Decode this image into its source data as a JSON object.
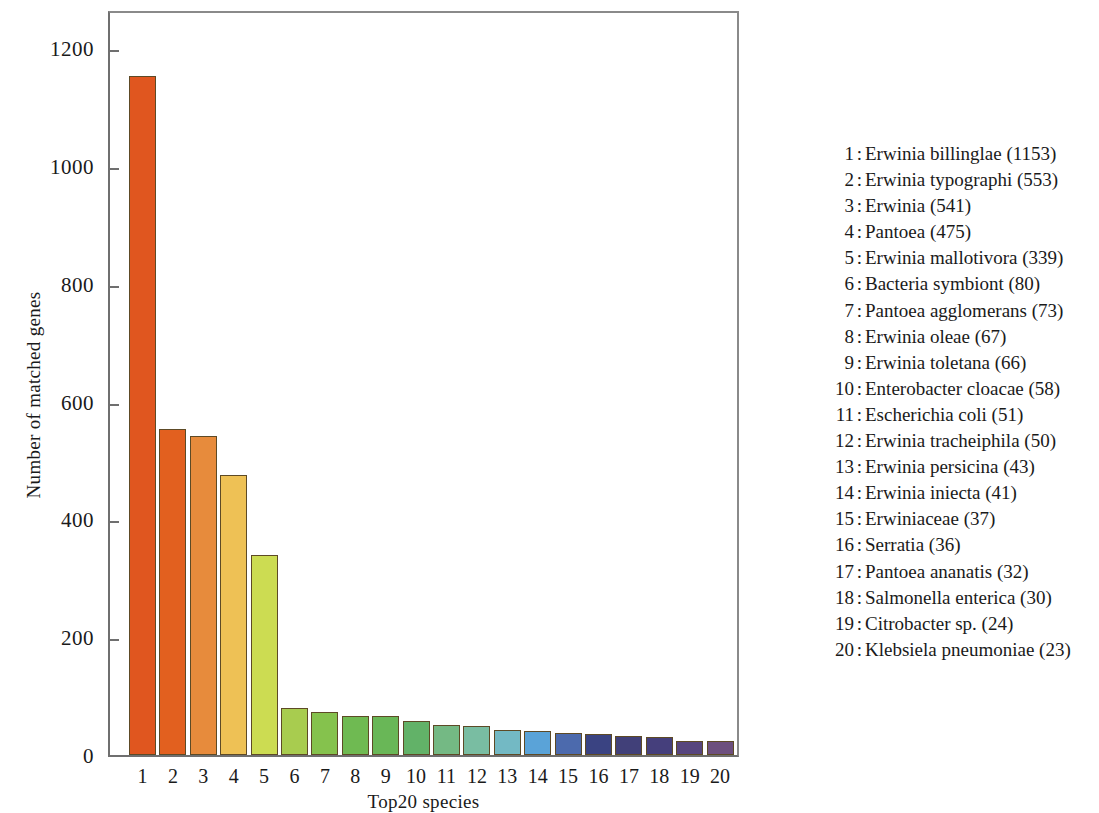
{
  "chart_data": {
    "type": "bar",
    "title": "",
    "xlabel": "Top20 species",
    "ylabel": "Number of matched genes",
    "categories": [
      "1",
      "2",
      "3",
      "4",
      "5",
      "6",
      "7",
      "8",
      "9",
      "10",
      "11",
      "12",
      "13",
      "14",
      "15",
      "16",
      "17",
      "18",
      "19",
      "20"
    ],
    "values": [
      1153,
      553,
      541,
      475,
      339,
      80,
      73,
      67,
      66,
      58,
      51,
      50,
      43,
      41,
      37,
      36,
      32,
      30,
      24,
      23
    ],
    "series_names": [
      "Erwinia billinglae",
      "Erwinia typographi",
      "Erwinia",
      "Pantoea",
      "Erwinia mallotivora",
      "Bacteria symbiont",
      "Pantoea agglomerans",
      "Erwinia oleae",
      "Erwinia toletana",
      "Enterobacter cloacae",
      "Escherichia coli",
      "Erwinia tracheiphila",
      "Erwinia persicina",
      "Erwinia iniecta",
      "Erwiniaceae",
      "Serratia",
      "Pantoea ananatis",
      "Salmonella enterica",
      "Citrobacter sp.",
      "Klebsiela pneumoniae"
    ],
    "bar_colors": [
      "#e0561f",
      "#e2601f",
      "#e78b3c",
      "#eec155",
      "#ccdc52",
      "#a8cc4f",
      "#85c24d",
      "#6fba52",
      "#69b757",
      "#62b268",
      "#74b984",
      "#79bda2",
      "#73b9c4",
      "#5aa3d8",
      "#4c6aad",
      "#3a4382",
      "#414079",
      "#453f7c",
      "#57457e",
      "#6d4f7e"
    ],
    "ylim": [
      0,
      1250
    ],
    "yticks": [
      0,
      200,
      400,
      600,
      800,
      1000,
      1200
    ],
    "ytick_labels": [
      "0",
      "200",
      "400",
      "600",
      "800",
      "1000",
      "1200"
    ],
    "grid": false,
    "legend_position": "right",
    "legend_separator": ":"
  },
  "legend": {
    "entries": [
      {
        "index": "1",
        "name": "Erwinia billinglae (1153)"
      },
      {
        "index": "2",
        "name": "Erwinia typographi (553)"
      },
      {
        "index": "3",
        "name": "Erwinia (541)"
      },
      {
        "index": "4",
        "name": "Pantoea (475)"
      },
      {
        "index": "5",
        "name": "Erwinia mallotivora (339)"
      },
      {
        "index": "6",
        "name": "Bacteria symbiont (80)"
      },
      {
        "index": "7",
        "name": "Pantoea agglomerans (73)"
      },
      {
        "index": "8",
        "name": "Erwinia oleae (67)"
      },
      {
        "index": "9",
        "name": "Erwinia toletana (66)"
      },
      {
        "index": "10",
        "name": "Enterobacter cloacae (58)"
      },
      {
        "index": "11",
        "name": "Escherichia coli (51)"
      },
      {
        "index": "12",
        "name": "Erwinia tracheiphila (50)"
      },
      {
        "index": "13",
        "name": "Erwinia persicina (43)"
      },
      {
        "index": "14",
        "name": "Erwinia iniecta (41)"
      },
      {
        "index": "15",
        "name": "Erwiniaceae (37)"
      },
      {
        "index": "16",
        "name": "Serratia (36)"
      },
      {
        "index": "17",
        "name": "Pantoea ananatis (32)"
      },
      {
        "index": "18",
        "name": "Salmonella enterica (30)"
      },
      {
        "index": "19",
        "name": "Citrobacter sp. (24)"
      },
      {
        "index": "20",
        "name": "Klebsiela pneumoniae (23)"
      }
    ],
    "separator": ":"
  },
  "axes": {
    "y_title": "Number of matched genes",
    "x_title": "Top20 species"
  }
}
